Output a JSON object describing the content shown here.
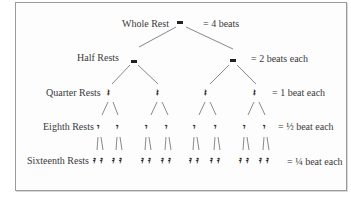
{
  "diagram": {
    "levels": [
      {
        "name": "Whole Rest",
        "value": "= 4 beats",
        "count": 1,
        "glyph": "whole-rest"
      },
      {
        "name": "Half Rests",
        "value": "= 2 beats each",
        "count": 2,
        "glyph": "half-rest"
      },
      {
        "name": "Quarter Rests",
        "value": "= 1 beat each",
        "count": 4,
        "glyph": "quarter-rest"
      },
      {
        "name": "Eighth Rests",
        "value": "= ½ beat each",
        "count": 8,
        "glyph": "eighth-rest"
      },
      {
        "name": "Sixteenth Rests",
        "value": "= ¼ beat each",
        "count": 16,
        "glyph": "sixteenth-rest"
      }
    ],
    "symbols": {
      "quarter": "𝄽",
      "eighth": "𝄾",
      "sixteenth": "𝄿"
    },
    "colors": {
      "line": "#6a6a6a",
      "text": "#3a3a3a",
      "border": "#9a9a9a"
    }
  }
}
